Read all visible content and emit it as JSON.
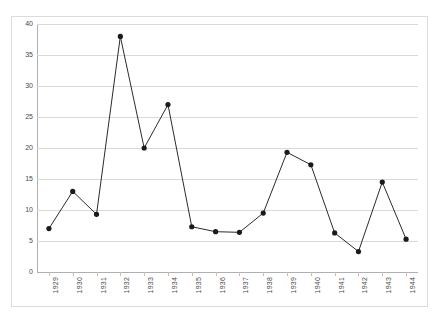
{
  "chart_data": {
    "type": "line",
    "title": "",
    "xlabel": "",
    "ylabel": "",
    "ylim": [
      0,
      40
    ],
    "yticks": [
      0,
      5,
      10,
      15,
      20,
      25,
      30,
      35,
      40
    ],
    "grid": true,
    "legend": "none",
    "marker": "filled-circle",
    "categories": [
      "1929",
      "1930",
      "1931",
      "1932",
      "1933",
      "1934",
      "1935",
      "1936",
      "1937",
      "1938",
      "1939",
      "1940",
      "1941",
      "1942",
      "1943",
      "1944"
    ],
    "values": [
      7,
      13,
      9.3,
      38,
      20,
      27,
      7.3,
      6.5,
      6.4,
      9.5,
      19.3,
      17.3,
      6.3,
      3.3,
      14.5,
      5.3
    ],
    "series": [
      {
        "name": "series-1",
        "values": [
          7,
          13,
          9.3,
          38,
          20,
          27,
          7.3,
          6.5,
          6.4,
          9.5,
          19.3,
          17.3,
          6.3,
          3.3,
          14.5,
          5.3
        ]
      }
    ]
  },
  "style": {
    "line_color": "#2b2b2b",
    "marker_color": "#1a1a1a",
    "grid_color": "#d9d9d9",
    "axis_color": "#b0b0b0",
    "frame_color": "#dcdcdc",
    "tick_label_color": "#4a4a4a",
    "background": "#ffffff"
  }
}
